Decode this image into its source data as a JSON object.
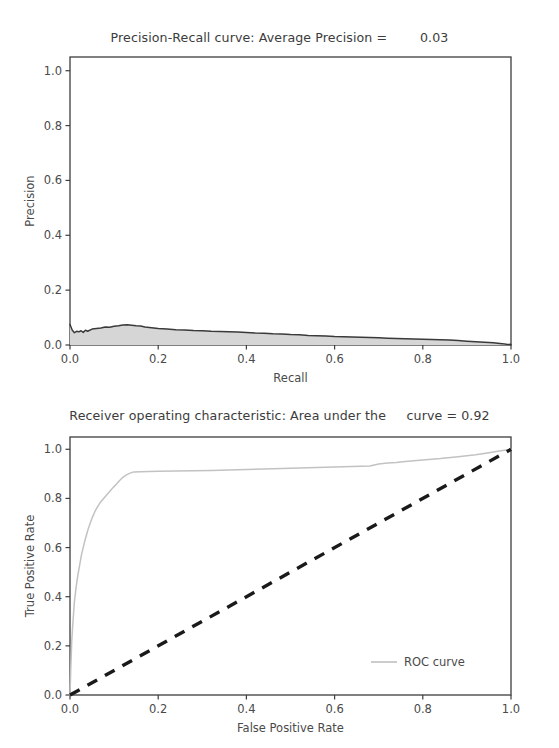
{
  "figure": {
    "background": "#ffffff",
    "width": 559,
    "height": 748
  },
  "chart_data": [
    {
      "type": "line",
      "id": "precision-recall",
      "title": "Precision-Recall curve: Average Precision =        0.03",
      "title_parts": {
        "prefix": "Precision-Recall curve: Average Precision =",
        "value": "0.03"
      },
      "xlabel": "Recall",
      "ylabel": "Precision",
      "xlim": [
        0.0,
        1.0
      ],
      "ylim": [
        0.0,
        1.05
      ],
      "xticks": [
        "0.0",
        "0.2",
        "0.4",
        "0.6",
        "0.8",
        "1.0"
      ],
      "xtick_values": [
        0.0,
        0.2,
        0.4,
        0.6,
        0.8,
        1.0
      ],
      "yticks": [
        "0.0",
        "0.2",
        "0.4",
        "0.6",
        "0.8",
        "1.0"
      ],
      "ytick_values": [
        0.0,
        0.2,
        0.4,
        0.6,
        0.8,
        1.0
      ],
      "grid": false,
      "legend": null,
      "average_precision": 0.03,
      "series": [
        {
          "name": "Precision-Recall curve",
          "color": "#3a3a3a",
          "fill_color": "#d6d6d6",
          "filled": true,
          "x": [
            0.0,
            0.005,
            0.01,
            0.015,
            0.02,
            0.025,
            0.03,
            0.035,
            0.04,
            0.05,
            0.06,
            0.07,
            0.08,
            0.09,
            0.1,
            0.11,
            0.12,
            0.13,
            0.14,
            0.15,
            0.16,
            0.17,
            0.18,
            0.19,
            0.2,
            0.22,
            0.24,
            0.26,
            0.28,
            0.3,
            0.32,
            0.34,
            0.36,
            0.38,
            0.4,
            0.42,
            0.44,
            0.46,
            0.48,
            0.5,
            0.52,
            0.54,
            0.56,
            0.58,
            0.6,
            0.62,
            0.64,
            0.66,
            0.68,
            0.7,
            0.72,
            0.74,
            0.76,
            0.78,
            0.8,
            0.82,
            0.84,
            0.86,
            0.88,
            0.9,
            0.92,
            0.94,
            0.96,
            0.98,
            0.99,
            1.0
          ],
          "y": [
            0.075,
            0.055,
            0.045,
            0.05,
            0.048,
            0.052,
            0.046,
            0.054,
            0.05,
            0.058,
            0.06,
            0.062,
            0.066,
            0.065,
            0.068,
            0.07,
            0.073,
            0.074,
            0.072,
            0.07,
            0.069,
            0.066,
            0.064,
            0.062,
            0.06,
            0.058,
            0.056,
            0.055,
            0.053,
            0.052,
            0.05,
            0.049,
            0.048,
            0.047,
            0.046,
            0.044,
            0.043,
            0.041,
            0.04,
            0.038,
            0.037,
            0.035,
            0.034,
            0.033,
            0.031,
            0.03,
            0.029,
            0.028,
            0.027,
            0.026,
            0.025,
            0.024,
            0.023,
            0.022,
            0.021,
            0.02,
            0.019,
            0.018,
            0.016,
            0.014,
            0.012,
            0.01,
            0.008,
            0.005,
            0.003,
            0.002
          ]
        }
      ]
    },
    {
      "type": "line",
      "id": "roc",
      "title": "Receiver operating characteristic: Area under the     curve = 0.92",
      "title_parts": {
        "prefix": "Receiver operating characteristic: Area under the",
        "value": "curve = 0.92"
      },
      "xlabel": "False Positive Rate",
      "ylabel": "True Positive Rate",
      "xlim": [
        0.0,
        1.0
      ],
      "ylim": [
        0.0,
        1.05
      ],
      "xticks": [
        "0.0",
        "0.2",
        "0.4",
        "0.6",
        "0.8",
        "1.0"
      ],
      "xtick_values": [
        0.0,
        0.2,
        0.4,
        0.6,
        0.8,
        1.0
      ],
      "yticks": [
        "0.0",
        "0.2",
        "0.4",
        "0.6",
        "0.8",
        "1.0"
      ],
      "ytick_values": [
        0.0,
        0.2,
        0.4,
        0.6,
        0.8,
        1.0
      ],
      "grid": false,
      "auc": 0.92,
      "legend": {
        "position": "lower right",
        "entries": [
          {
            "label": "ROC curve",
            "color": "#bfbfbf",
            "style": "solid"
          }
        ]
      },
      "series": [
        {
          "name": "ROC curve",
          "color": "#c2c2c2",
          "style": "solid",
          "x": [
            0.0,
            0.002,
            0.004,
            0.006,
            0.008,
            0.01,
            0.014,
            0.018,
            0.022,
            0.026,
            0.03,
            0.034,
            0.038,
            0.042,
            0.046,
            0.05,
            0.056,
            0.062,
            0.068,
            0.074,
            0.08,
            0.086,
            0.092,
            0.098,
            0.105,
            0.112,
            0.12,
            0.128,
            0.136,
            0.145,
            0.16,
            0.18,
            0.2,
            0.24,
            0.28,
            0.32,
            0.36,
            0.4,
            0.44,
            0.48,
            0.52,
            0.56,
            0.6,
            0.64,
            0.68,
            0.7,
            0.72,
            0.74,
            0.76,
            0.8,
            0.84,
            0.88,
            0.92,
            0.95,
            0.97,
            0.985,
            1.0
          ],
          "y": [
            0.0,
            0.12,
            0.22,
            0.28,
            0.33,
            0.38,
            0.44,
            0.49,
            0.53,
            0.57,
            0.6,
            0.63,
            0.655,
            0.68,
            0.7,
            0.72,
            0.745,
            0.765,
            0.782,
            0.795,
            0.808,
            0.82,
            0.832,
            0.845,
            0.858,
            0.872,
            0.886,
            0.896,
            0.903,
            0.908,
            0.909,
            0.91,
            0.911,
            0.912,
            0.913,
            0.914,
            0.916,
            0.918,
            0.92,
            0.922,
            0.924,
            0.926,
            0.928,
            0.93,
            0.932,
            0.94,
            0.944,
            0.946,
            0.95,
            0.956,
            0.962,
            0.97,
            0.978,
            0.986,
            0.992,
            0.996,
            1.0
          ]
        },
        {
          "name": "chance-diagonal",
          "color": "#1a1a1a",
          "style": "dashed",
          "x": [
            0.0,
            1.0
          ],
          "y": [
            0.0,
            1.0
          ]
        }
      ]
    }
  ]
}
